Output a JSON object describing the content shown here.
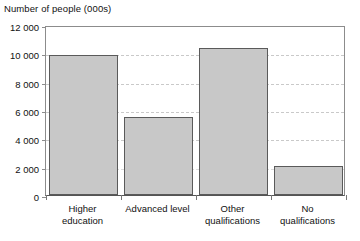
{
  "chart_data": {
    "type": "bar",
    "title": "Number of people (000s)",
    "xlabel": "",
    "ylabel": "",
    "categories": [
      "Higher education",
      "Advanced level",
      "Other qualifications",
      "No qualifications"
    ],
    "category_lines": [
      [
        "Higher",
        "education"
      ],
      [
        "Advanced level"
      ],
      [
        "Other",
        "qualifications"
      ],
      [
        "No",
        "qualifications"
      ]
    ],
    "values": [
      9850,
      5500,
      10400,
      2050
    ],
    "ylim": [
      0,
      12000
    ],
    "ytick_values": [
      12000,
      10000,
      8000,
      6000,
      4000,
      2000,
      0
    ],
    "ytick_labels": [
      "12 000",
      "10 000",
      "8 000",
      "6 000",
      "4 000",
      "2 000",
      "0"
    ],
    "grid": true,
    "grid_axis": "y",
    "legend": false,
    "colors": {
      "bar_fill": "#c8c8c8",
      "bar_border": "#5a5a5a",
      "grid": "#c9c9c9",
      "axis": "#8c8c8c",
      "text": "#111111",
      "background": "#ffffff"
    }
  }
}
